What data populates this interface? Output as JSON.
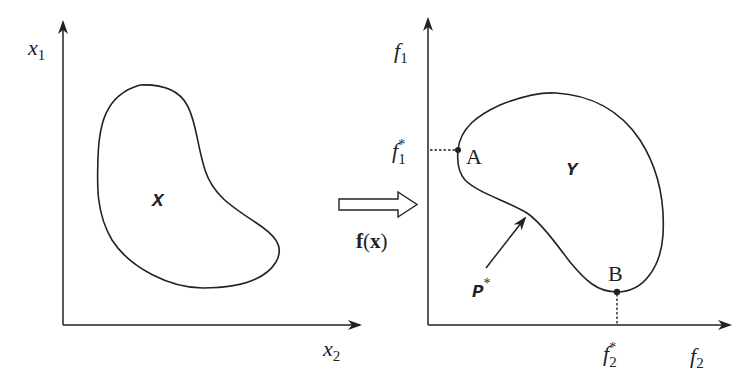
{
  "colors": {
    "stroke": "#222222",
    "background": "#ffffff"
  },
  "left_panel": {
    "y_axis_label": {
      "base": "x",
      "sub": "1"
    },
    "x_axis_label": {
      "base": "x",
      "sub": "2"
    },
    "region_label": "X"
  },
  "mapping": {
    "label_f": "f",
    "label_open": "(",
    "label_x": "x",
    "label_close": ")"
  },
  "right_panel": {
    "y_axis_label": {
      "base": "f",
      "sub": "1"
    },
    "x_axis_label": {
      "base": "f",
      "sub": "2"
    },
    "f1_star": {
      "base": "f",
      "sup": "*",
      "sub": "1"
    },
    "f2_star": {
      "base": "f",
      "sup": "*",
      "sub": "2"
    },
    "region_label": "Y",
    "point_a": "A",
    "point_b": "B",
    "pareto_label": {
      "base": "P",
      "sup": "*"
    }
  }
}
